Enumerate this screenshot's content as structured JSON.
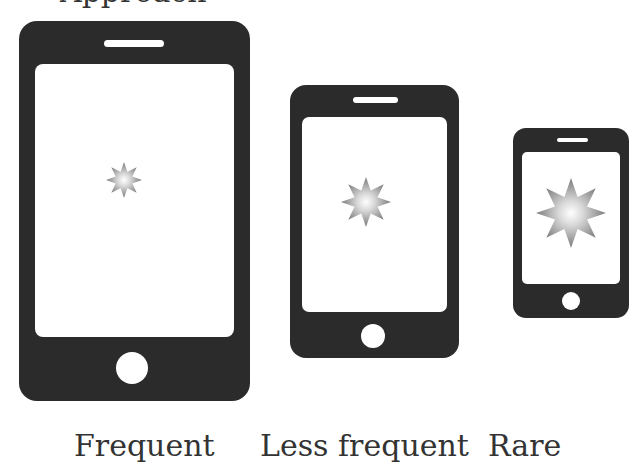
{
  "header": {
    "partial_text": "Approach"
  },
  "phones": [
    {
      "name": "large",
      "label": "Frequent",
      "star_icon": "burst-star-icon"
    },
    {
      "name": "medium",
      "label": "Less frequent",
      "star_icon": "burst-star-icon"
    },
    {
      "name": "small",
      "label": "Rare",
      "star_icon": "burst-star-icon"
    }
  ],
  "colors": {
    "phone_body": "#2b2b2b",
    "screen": "#ffffff",
    "star": "#8a8a8a",
    "text": "#333333"
  }
}
